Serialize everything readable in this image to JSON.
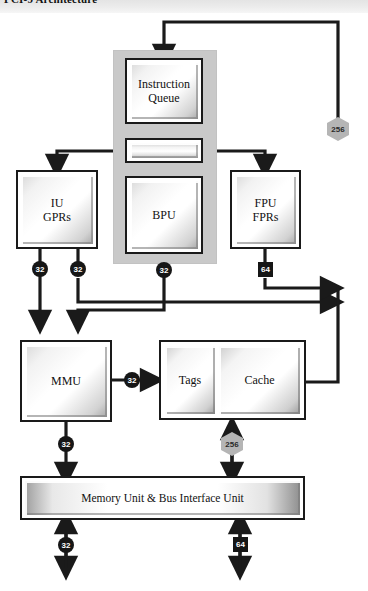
{
  "header": {
    "title": "PCI-9 Architecture"
  },
  "diagram": {
    "panel_label": "instruction-unit-panel",
    "blocks": [
      {
        "id": "instruction-queue",
        "label": "Instruction\nQueue",
        "line1": "Instruction",
        "line2": "Queue"
      },
      {
        "id": "dispatch-bar",
        "label": "",
        "line1": "",
        "line2": ""
      },
      {
        "id": "iu-gprs",
        "label": "IU GPRs",
        "line1": "IU",
        "line2": "GPRs"
      },
      {
        "id": "bpu",
        "label": "BPU",
        "line1": "BPU",
        "line2": ""
      },
      {
        "id": "fpu-fprs",
        "label": "FPU FPRs",
        "line1": "FPU",
        "line2": "FPRs"
      },
      {
        "id": "mmu",
        "label": "MMU",
        "line1": "MMU",
        "line2": ""
      },
      {
        "id": "tags",
        "label": "Tags"
      },
      {
        "id": "cache",
        "label": "Cache"
      },
      {
        "id": "memory-unit",
        "label": "Memory Unit & Bus Interface Unit"
      }
    ],
    "bus_badges": [
      {
        "id": "bus-256-top-right",
        "value": "256",
        "shape": "hexagon"
      },
      {
        "id": "bus-32-iu-left",
        "value": "32",
        "shape": "circle"
      },
      {
        "id": "bus-32-iu-right",
        "value": "32",
        "shape": "circle"
      },
      {
        "id": "bus-32-bpu",
        "value": "32",
        "shape": "circle"
      },
      {
        "id": "bus-64-fpu",
        "value": "64",
        "shape": "square"
      },
      {
        "id": "bus-32-mmu-cache",
        "value": "32",
        "shape": "circle"
      },
      {
        "id": "bus-32-mmu-down",
        "value": "32",
        "shape": "circle"
      },
      {
        "id": "bus-256-cache",
        "value": "256",
        "shape": "hexagon"
      },
      {
        "id": "bus-32-memory",
        "value": "32",
        "shape": "circle"
      },
      {
        "id": "bus-64-memory",
        "value": "64",
        "shape": "square"
      }
    ],
    "colors": {
      "line": "#1a1a1a",
      "panel": "#c9c9c9",
      "badge_dark": "#161616",
      "badge_hex": "#b5b5b5",
      "page": "#ffffff"
    }
  }
}
